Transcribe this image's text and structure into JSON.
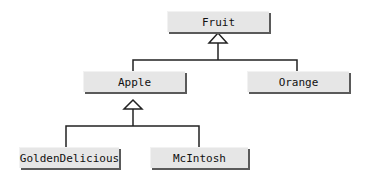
{
  "diagram": {
    "type": "class-hierarchy",
    "nodes": [
      {
        "id": "fruit",
        "label": "Fruit"
      },
      {
        "id": "apple",
        "label": "Apple"
      },
      {
        "id": "orange",
        "label": "Orange"
      },
      {
        "id": "golden",
        "label": "GoldenDelicious"
      },
      {
        "id": "mcintosh",
        "label": "McIntosh"
      }
    ],
    "edges": [
      {
        "from": "apple",
        "to": "fruit",
        "kind": "inheritance"
      },
      {
        "from": "orange",
        "to": "fruit",
        "kind": "inheritance"
      },
      {
        "from": "golden",
        "to": "apple",
        "kind": "inheritance"
      },
      {
        "from": "mcintosh",
        "to": "apple",
        "kind": "inheritance"
      }
    ],
    "colors": {
      "box_fill": "#e6e6e6",
      "box_shadow": "#5a5a5a",
      "line": "#222222",
      "background": "#ffffff"
    }
  }
}
